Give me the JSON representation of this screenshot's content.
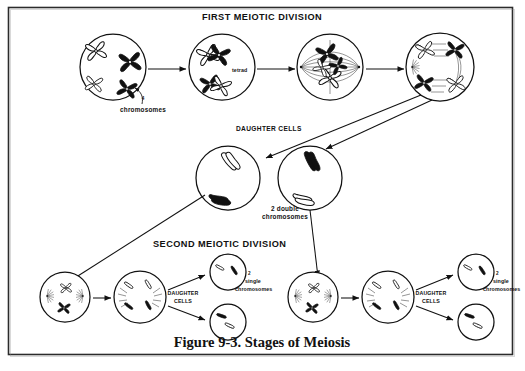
{
  "figure": {
    "caption": "Figure 9-3.  Stages of Meiosis",
    "border_color": "#2b2b2b",
    "ink_color": "#111111",
    "background": "#ffffff"
  },
  "sections": {
    "first_division_title": "FIRST MEIOTIC DIVISION",
    "second_division_title": "SECOND MEIOTIC DIVISION"
  },
  "labels": {
    "chromosomes_count": "4",
    "chromosomes": "chromosomes",
    "tetrad": "tetrad",
    "daughter_cells_upper": "DAUGHTER CELLS",
    "two_double_line1": "2 double",
    "two_double_line2": "chromosomes",
    "daughter_cells_line1": "DAUGHTER",
    "daughter_cells_line2": "CELLS",
    "single_count": "2",
    "single_word": "single",
    "single_chromosomes": "chromosomes"
  },
  "stages": {
    "row1": [
      {
        "name": "prophase-i-early",
        "desc": "4 chromosomes, 2 white and 2 black"
      },
      {
        "name": "prophase-i-tetrad",
        "desc": "tetrad pairing of homologous chromosomes"
      },
      {
        "name": "metaphase-i",
        "desc": "tetrads aligned on spindle at equator"
      },
      {
        "name": "anaphase-i",
        "desc": "homologous pairs separating to poles"
      }
    ],
    "row2": [
      {
        "name": "daughter-cell-left",
        "desc": "2 double chromosomes"
      },
      {
        "name": "daughter-cell-right",
        "desc": "2 double chromosomes"
      }
    ],
    "row3_left": [
      {
        "name": "prophase-ii-left",
        "desc": "double chromosomes with spindle forming"
      },
      {
        "name": "anaphase-ii-left",
        "desc": "chromatids separating"
      },
      {
        "name": "gamete-left-top",
        "desc": "2 single chromosomes"
      },
      {
        "name": "gamete-left-bottom",
        "desc": "2 single chromosomes"
      }
    ],
    "row3_right": [
      {
        "name": "prophase-ii-right",
        "desc": "double chromosomes with spindle forming"
      },
      {
        "name": "anaphase-ii-right",
        "desc": "chromatids separating"
      },
      {
        "name": "gamete-right-top",
        "desc": "2 single chromosomes"
      },
      {
        "name": "gamete-right-bottom",
        "desc": "2 single chromosomes"
      }
    ]
  }
}
